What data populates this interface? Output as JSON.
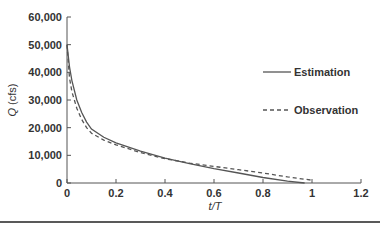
{
  "chart_data": {
    "type": "line",
    "title": "",
    "xlabel": "t/T",
    "ylabel": "Q (cfs)",
    "xlim": [
      0,
      1.2
    ],
    "ylim": [
      0,
      60000
    ],
    "x_ticks": [
      "0",
      "0.2",
      "0.4",
      "0.6",
      "0.8",
      "1",
      "1.2"
    ],
    "y_ticks": [
      "0",
      "10,000",
      "20,000",
      "30,000",
      "40,000",
      "50,000",
      "60,000"
    ],
    "grid": false,
    "legend_position": "right",
    "series": [
      {
        "name": "Estimation",
        "style": "solid",
        "x": [
          0,
          0.01,
          0.02,
          0.04,
          0.06,
          0.08,
          0.1,
          0.15,
          0.2,
          0.3,
          0.4,
          0.5,
          0.6,
          0.7,
          0.8,
          0.9,
          0.97
        ],
        "y": [
          50000,
          42000,
          37000,
          30000,
          25500,
          22000,
          19500,
          16500,
          14500,
          11500,
          9000,
          7000,
          5200,
          3600,
          2000,
          700,
          0
        ]
      },
      {
        "name": "Observation",
        "style": "dashed",
        "x": [
          0,
          0.01,
          0.02,
          0.04,
          0.06,
          0.08,
          0.1,
          0.15,
          0.2,
          0.3,
          0.4,
          0.5,
          0.6,
          0.7,
          0.8,
          0.9,
          1.0
        ],
        "y": [
          50000,
          38000,
          33000,
          27000,
          23000,
          20000,
          18000,
          15500,
          13800,
          11000,
          8800,
          7200,
          6000,
          4800,
          3600,
          2200,
          1000
        ]
      }
    ]
  }
}
